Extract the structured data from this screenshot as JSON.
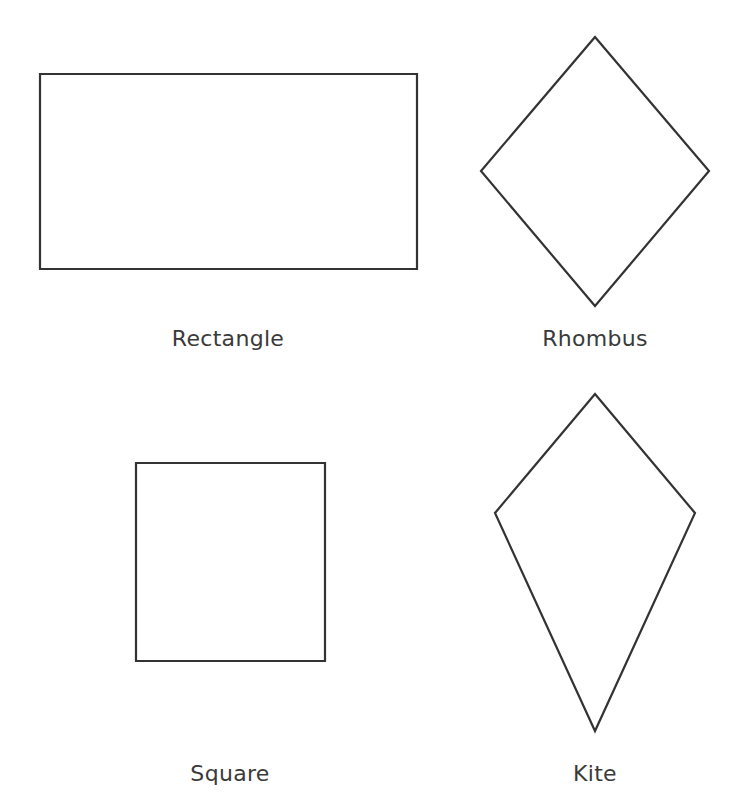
{
  "diagram": {
    "stroke_color": "#333333",
    "text_color": "#3a3a3a",
    "background": "#ffffff",
    "shapes": [
      {
        "name": "Rectangle",
        "type": "polygon",
        "points": [
          [
            40,
            74
          ],
          [
            417,
            74
          ],
          [
            417,
            269
          ],
          [
            40,
            269
          ]
        ],
        "label": "Rectangle",
        "label_pos": [
          228,
          328
        ]
      },
      {
        "name": "Rhombus",
        "type": "polygon",
        "points": [
          [
            595,
            37
          ],
          [
            709,
            171
          ],
          [
            595,
            306
          ],
          [
            481,
            171
          ]
        ],
        "label": "Rhombus",
        "label_pos": [
          595,
          328
        ]
      },
      {
        "name": "Square",
        "type": "polygon",
        "points": [
          [
            136,
            463
          ],
          [
            325,
            463
          ],
          [
            325,
            661
          ],
          [
            136,
            661
          ]
        ],
        "label": "Square",
        "label_pos": [
          230,
          763
        ]
      },
      {
        "name": "Kite",
        "type": "polygon",
        "points": [
          [
            595,
            394
          ],
          [
            695,
            513
          ],
          [
            595,
            731
          ],
          [
            495,
            513
          ]
        ],
        "label": "Kite",
        "label_pos": [
          595,
          763
        ]
      }
    ]
  }
}
